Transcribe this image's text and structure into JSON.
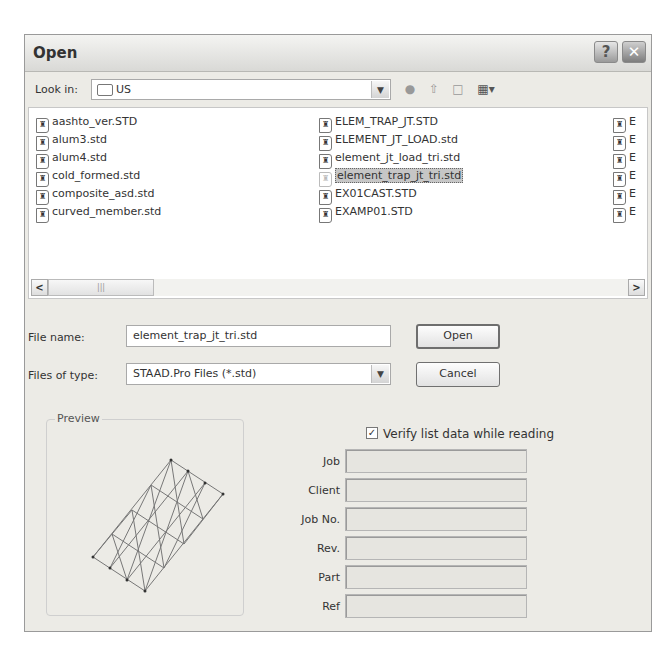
{
  "dialog": {
    "title": "Open",
    "help_label": "?",
    "close_label": "✕"
  },
  "look_in": {
    "label": "Look in:",
    "value": "US",
    "folder_icon": "folder-icon",
    "toolbar_icons": [
      "back-icon",
      "up-folder-icon",
      "new-folder-icon",
      "view-menu-icon"
    ]
  },
  "files": {
    "columns": [
      [
        "aashto_ver.STD",
        "alum3.std",
        "alum4.std",
        "cold_formed.std",
        "composite_asd.std",
        "curved_member.std"
      ],
      [
        "ELEM_TRAP_JT.STD",
        "ELEMENT_JT_LOAD.std",
        "element_jt_load_tri.std",
        "element_trap_jt_tri.std",
        "EX01CAST.STD",
        "EXAMP01.STD"
      ],
      [
        "E",
        "E",
        "E",
        "E",
        "E",
        "E"
      ]
    ],
    "selected": "element_trap_jt_tri.std"
  },
  "scrollbar": {
    "left_arrow": "<",
    "right_arrow": ">",
    "thumb_grip": "|||"
  },
  "file_name": {
    "label": "File name:",
    "value": "element_trap_jt_tri.std"
  },
  "file_type": {
    "label": "Files of type:",
    "value": "STAAD.Pro Files (*.std)"
  },
  "buttons": {
    "open": "Open",
    "cancel": "Cancel"
  },
  "preview": {
    "title": "Preview"
  },
  "verify": {
    "label": "Verify list data while reading",
    "checked": true,
    "check_mark": "✓"
  },
  "fields": [
    {
      "label": "Job",
      "value": ""
    },
    {
      "label": "Client",
      "value": ""
    },
    {
      "label": "Job No.",
      "value": ""
    },
    {
      "label": "Rev.",
      "value": ""
    },
    {
      "label": "Part",
      "value": ""
    },
    {
      "label": "Ref",
      "value": ""
    }
  ]
}
